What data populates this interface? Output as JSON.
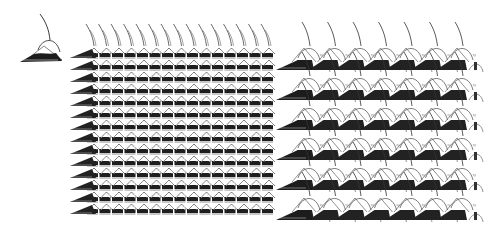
{
  "figure": {
    "ink_color": "#1a1a1a",
    "paper_color": "#ffffff",
    "panels": [
      {
        "id": "prototile",
        "label": "single tile",
        "x": 18,
        "y": 12,
        "width": 50,
        "height": 52
      },
      {
        "id": "dense-tiling",
        "label": "dense tiling",
        "x": 70,
        "y": 10,
        "width": 200,
        "height": 208,
        "columns": 15,
        "rows": 14,
        "col_spacing": 12.5,
        "row_spacing": 12
      },
      {
        "id": "sparse-tiling",
        "label": "sparse tiling",
        "x": 276,
        "y": 12,
        "width": 200,
        "height": 206,
        "columns": 7,
        "rows": 6,
        "col_spacing": 25.5,
        "row_spacing": 30,
        "tile_marker": "small unreadable tile label"
      }
    ]
  }
}
